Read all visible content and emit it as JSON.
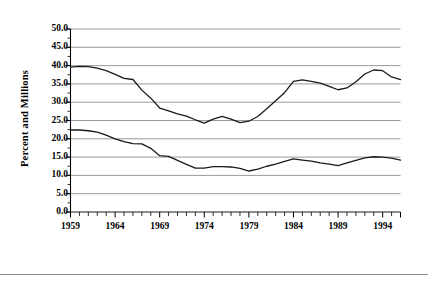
{
  "figure": {
    "background_color": "#ffffff",
    "line_color": "#1a1a1a",
    "grid_color": "#808080",
    "axis_color": "#000000",
    "rule_color": "#8a8a8a"
  },
  "chart_data": {
    "type": "line",
    "title": "",
    "subtitle": "",
    "xlabel": "",
    "ylabel": "Percent and Millions",
    "xlim": [
      1959,
      1996
    ],
    "ylim": [
      0.0,
      50.0
    ],
    "grid": true,
    "grid_axis": "y",
    "legend": "none",
    "ytick_labels": [
      "50.0",
      "45.0",
      "40.0",
      "35.0",
      "30.0",
      "25.0",
      "20.0",
      "15.0",
      "10.0",
      "5.0",
      "0.0"
    ],
    "ytick_values": [
      50.0,
      45.0,
      40.0,
      35.0,
      30.0,
      25.0,
      20.0,
      15.0,
      10.0,
      5.0,
      0.0
    ],
    "xtick_labels": [
      "1959",
      "1964",
      "1969",
      "1974",
      "1979",
      "1984",
      "1989",
      "1994"
    ],
    "xtick_values": [
      1959,
      1964,
      1969,
      1974,
      1979,
      1984,
      1989,
      1994
    ],
    "xtick_minor_step": 1,
    "x": [
      1959,
      1960,
      1961,
      1962,
      1963,
      1964,
      1965,
      1966,
      1967,
      1968,
      1969,
      1970,
      1971,
      1972,
      1973,
      1974,
      1975,
      1976,
      1977,
      1978,
      1979,
      1980,
      1981,
      1982,
      1983,
      1984,
      1985,
      1986,
      1987,
      1988,
      1989,
      1990,
      1991,
      1992,
      1993,
      1994,
      1995,
      1996
    ],
    "series": [
      {
        "name": "Percent",
        "values": [
          39.6,
          39.8,
          39.7,
          39.3,
          38.6,
          37.6,
          36.5,
          36.2,
          33.3,
          31.1,
          28.4,
          27.6,
          26.8,
          26.2,
          25.2,
          24.3,
          25.4,
          26.1,
          25.4,
          24.4,
          24.8,
          26.1,
          28.2,
          30.4,
          32.6,
          35.7,
          36.1,
          35.7,
          35.2,
          34.3,
          33.4,
          33.9,
          35.6,
          37.7,
          38.8,
          38.6,
          36.9,
          36.2
        ]
      },
      {
        "name": "Millions",
        "values": [
          22.4,
          22.4,
          22.2,
          21.8,
          21.0,
          20.0,
          19.2,
          18.7,
          18.6,
          17.4,
          15.4,
          15.2,
          14.1,
          13.0,
          12.0,
          12.0,
          12.4,
          12.4,
          12.3,
          11.9,
          11.2,
          11.7,
          12.5,
          13.1,
          13.8,
          14.5,
          14.2,
          13.9,
          13.4,
          13.1,
          12.7,
          13.4,
          14.1,
          14.8,
          15.1,
          15.0,
          14.7,
          14.2
        ]
      }
    ]
  }
}
